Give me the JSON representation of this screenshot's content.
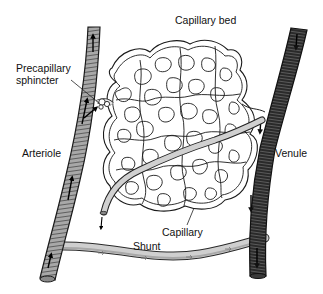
{
  "diagram": {
    "title": "Capillary bed",
    "labels": {
      "capillary_bed": "Capillary bed",
      "precapillary_line1": "Precapillary",
      "precapillary_line2": "sphincter",
      "arteriole": "Arteriole",
      "venule": "Venule",
      "capillary": "Capillary",
      "shunt": "Shunt"
    },
    "colors": {
      "background": "#ffffff",
      "arteriole_fill": "#9a9a9a",
      "arteriole_band": "#6e6e6e",
      "venule_fill": "#2e2e2e",
      "venule_band": "#555555",
      "shunt_fill": "#c4c4c4",
      "capillary_stroke": "#222222",
      "text": "#111111"
    },
    "flow_direction": {
      "arteriole": "up",
      "venule": "down",
      "shunt": "left-to-right"
    }
  }
}
